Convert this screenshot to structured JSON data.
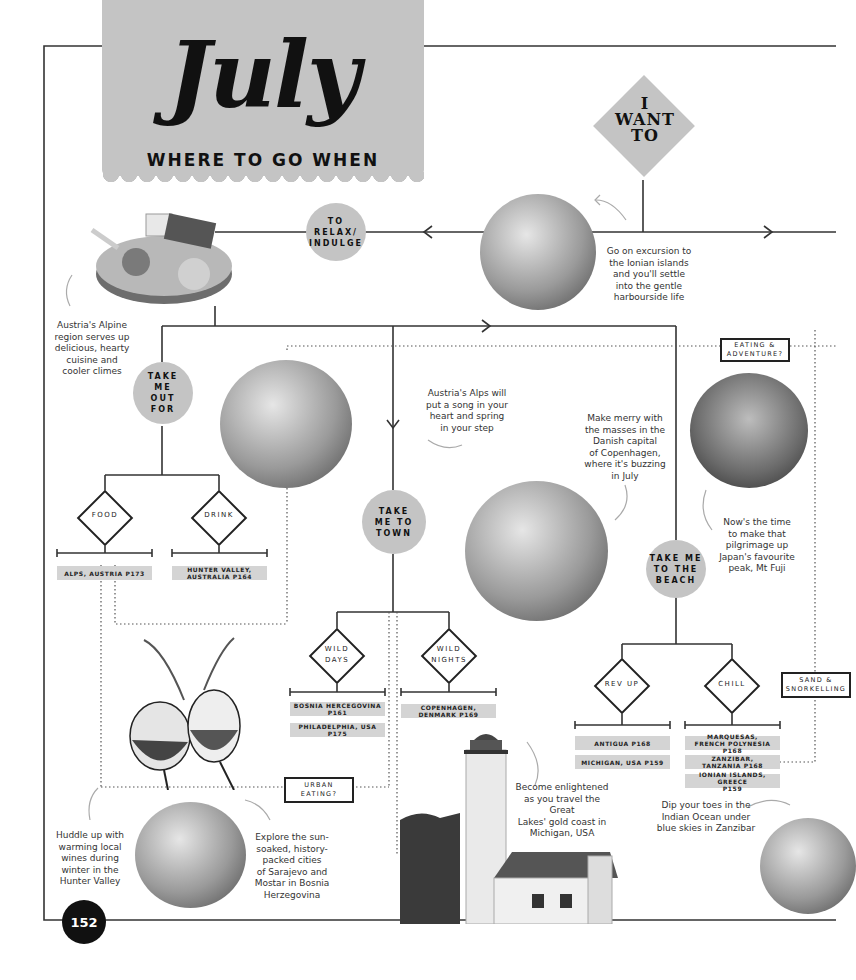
{
  "header": {
    "month": "July",
    "subtitle": "WHERE TO GO WHEN",
    "start_node": "I\nWANT\nTO"
  },
  "nodes": {
    "relax": "TO\nRELAX/\nINDULGE",
    "take_me_out_for": "TAKE\nME\nOUT\nFOR",
    "take_me_to_town": "TAKE\nME TO\nTOWN",
    "take_me_to_beach": "TAKE ME\nTO THE\nBEACH"
  },
  "decisions": {
    "food": "FOOD",
    "drink": "DRINK",
    "wild_days": "WILD\nDAYS",
    "wild_nights": "WILD\nNIGHTS",
    "rev_up": "REV UP",
    "chill": "CHILL"
  },
  "destinations": {
    "food": [
      "ALPS, AUSTRIA P173"
    ],
    "drink": [
      "HUNTER VALLEY,\nAUSTRALIA P164"
    ],
    "wild_days": [
      "BOSNIA HERCEGOVINA\nP161",
      "PHILADELPHIA, USA P175"
    ],
    "wild_nights": [
      "COPENHAGEN,\nDENMARK P169"
    ],
    "rev_up": [
      "ANTIGUA P168",
      "MICHIGAN, USA P159"
    ],
    "chill": [
      "MARQUESAS,\nFRENCH POLYNESIA P168",
      "ZANZIBAR,\nTANZANIA P168",
      "IONIAN ISLANDS, GREECE\nP159"
    ]
  },
  "cross_links": {
    "eating_adventure": "EATING &\nADVENTURE?",
    "urban_eating": "URBAN\nEATING?",
    "sand_snorkelling": "SAND &\nSNORKELLING"
  },
  "captions": {
    "ionian": "Go on excursion to\nthe Ionian islands\nand you'll settle\ninto the gentle\nharbourside life",
    "austria_alpine": "Austria's Alpine\nregion serves up\ndelicious, hearty\ncuisine and\ncooler climes",
    "austria_alps": "Austria's Alps will\nput a song in your\nheart and spring\nin your step",
    "copenhagen": "Make merry with\nthe masses in the\nDanish capital\nof Copenhagen,\nwhere it's buzzing\nin July",
    "mt_fuji": "Now's the time\nto make that\npilgrimage up\nJapan's favourite\npeak, Mt Fuji",
    "michigan": "Become enlightened\nas you travel the Great\nLakes' gold coast in\nMichigan, USA",
    "zanzibar": "Dip your toes in the\nIndian Ocean under\nblue skies in Zanzibar",
    "hunter_valley": "Huddle up with\nwarming local\nwines during\nwinter in the\nHunter Valley",
    "bosnia": "Explore the sun-\nsoaked, history-\npacked cities\nof Sarajevo and\nMostar in Bosnia\nHerzegovina"
  },
  "images": {
    "harbour": "harbour-boats-photo",
    "cheese_board": "cheese-board-photo",
    "alps_couple": "alpine-couple-photo",
    "copenhagen": "nyhavn-photo",
    "mt_fuji": "mt-fuji-photo",
    "wine_glasses": "wine-glasses-photo",
    "mostar": "mostar-photo",
    "lighthouse": "lighthouse-photo",
    "zanzibar_child": "zanzibar-child-photo"
  },
  "page": {
    "number": "152"
  },
  "colors": {
    "node_gray": "#c4c4c4",
    "tag_gray": "#d4d4d4",
    "line": "#222222",
    "page_badge": "#111111"
  }
}
